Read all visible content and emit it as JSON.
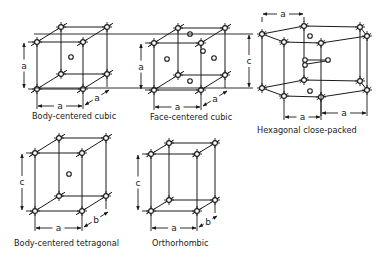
{
  "figure": {
    "panels": [
      {
        "id": "bcc",
        "caption": "Body-centered cubic",
        "dimensions": {
          "height": "a",
          "width": "a",
          "depth": "a"
        },
        "extra_atoms": "body center"
      },
      {
        "id": "fcc",
        "caption": "Face-centered cubic",
        "dimensions": {
          "height": "a",
          "width": "a",
          "depth": "a"
        },
        "extra_atoms": "face centers"
      },
      {
        "id": "hcp",
        "caption": "Hexagonal close-packed",
        "dimensions": {
          "height": "c",
          "width": "a",
          "depth": "a",
          "top": "a"
        },
        "extra_atoms": "interior triplet"
      },
      {
        "id": "bct",
        "caption": "Body-centered tetragonal",
        "dimensions": {
          "height": "c",
          "width": "a",
          "depth": "b"
        },
        "extra_atoms": "body center"
      },
      {
        "id": "ortho",
        "caption": "Orthorhombic",
        "dimensions": {
          "height": "c",
          "width": "a",
          "depth": "b"
        },
        "extra_atoms": "none"
      }
    ]
  }
}
